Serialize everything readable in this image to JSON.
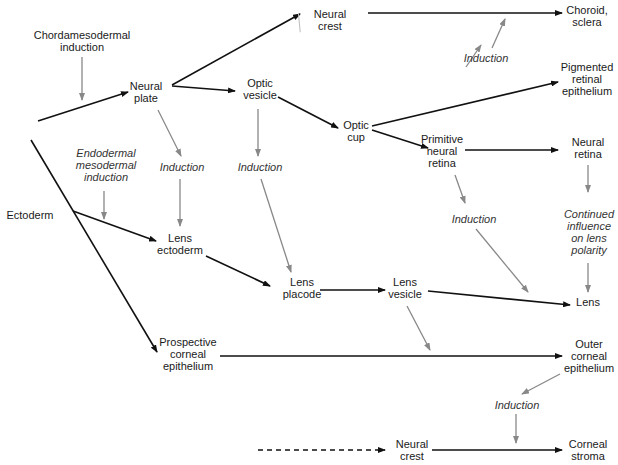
{
  "nodes": [
    {
      "id": "ectoderm",
      "label": "Ectoderm",
      "x": 30,
      "y": 215
    },
    {
      "id": "chordamesodermal",
      "label": "Chordamesodermal\ninduction",
      "x": 82,
      "y": 41,
      "italic": false
    },
    {
      "id": "neural_plate",
      "label": "Neural\nplate",
      "x": 146,
      "y": 92
    },
    {
      "id": "optic_vesicle",
      "label": "Optic\nvesicle",
      "x": 260,
      "y": 89
    },
    {
      "id": "neural_crest_top",
      "label": "Neural\ncrest",
      "x": 330,
      "y": 20
    },
    {
      "id": "choroid_sclera",
      "label": "Choroid,\nsclera",
      "x": 587,
      "y": 16
    },
    {
      "id": "induction_top",
      "label": "Induction",
      "x": 486,
      "y": 58,
      "italic": true
    },
    {
      "id": "pigmented",
      "label": "Pigmented\nretinal\nepithelium",
      "x": 587,
      "y": 79
    },
    {
      "id": "optic_cup",
      "label": "Optic\ncup",
      "x": 356,
      "y": 131
    },
    {
      "id": "primitive_retina",
      "label": "Primitive\nneural\nretina",
      "x": 442,
      "y": 151
    },
    {
      "id": "neural_retina",
      "label": "Neural\nretina",
      "x": 588,
      "y": 148
    },
    {
      "id": "endo_meso",
      "label": "Endodermal\nmesodermal\ninduction",
      "x": 106,
      "y": 165,
      "italic": true
    },
    {
      "id": "induction_np",
      "label": "Induction",
      "x": 182,
      "y": 167,
      "italic": true
    },
    {
      "id": "induction_ov",
      "label": "Induction",
      "x": 260,
      "y": 167,
      "italic": true
    },
    {
      "id": "induction_pr",
      "label": "Induction",
      "x": 474,
      "y": 219,
      "italic": true
    },
    {
      "id": "continued",
      "label": "Continued\ninfluence\non lens\npolarity",
      "x": 589,
      "y": 232,
      "italic": true
    },
    {
      "id": "lens_ectoderm",
      "label": "Lens\nectoderm",
      "x": 180,
      "y": 244
    },
    {
      "id": "lens_placode",
      "label": "Lens\nplacode",
      "x": 302,
      "y": 288
    },
    {
      "id": "lens_vesicle",
      "label": "Lens\nvesicle",
      "x": 405,
      "y": 288
    },
    {
      "id": "lens",
      "label": "Lens",
      "x": 588,
      "y": 302
    },
    {
      "id": "prospective_corneal",
      "label": "Prospective\ncorneal\nepithelium",
      "x": 188,
      "y": 354
    },
    {
      "id": "outer_corneal",
      "label": "Outer\ncorneal\nepithelium",
      "x": 589,
      "y": 356
    },
    {
      "id": "induction_oc",
      "label": "Induction",
      "x": 517,
      "y": 405,
      "italic": true
    },
    {
      "id": "neural_crest_bottom",
      "label": "Neural\ncrest",
      "x": 412,
      "y": 450
    },
    {
      "id": "corneal_stroma",
      "label": "Corneal\nstroma",
      "x": 588,
      "y": 450
    }
  ],
  "colors": {
    "main_arrow": "#111111",
    "induction_arrow": "#888888",
    "text": "#1a1a1a"
  }
}
